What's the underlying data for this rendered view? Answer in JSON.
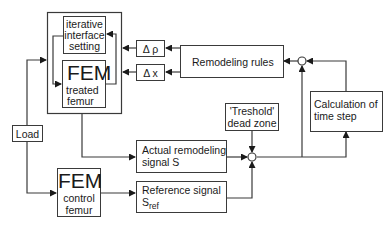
{
  "diagram": {
    "type": "block-flow",
    "blocks": {
      "iterative": {
        "lines": [
          "iterative",
          "interface",
          "setting"
        ]
      },
      "fem_treated": {
        "title": "FEM",
        "lines": [
          "treated",
          "femur"
        ]
      },
      "delta_rho": {
        "label": "Δ ρ"
      },
      "delta_x": {
        "label": "Δ x"
      },
      "remodeling_rules": {
        "label": "Remodeling rules"
      },
      "calc_time_step": {
        "lines": [
          "Calculation of",
          "time step"
        ]
      },
      "threshold": {
        "lines": [
          "'Treshold'",
          "dead zone"
        ]
      },
      "actual_signal": {
        "lines": [
          "Actual remodeling",
          "signal S"
        ]
      },
      "reference_signal": {
        "line1": "Reference signal",
        "symbol": "S",
        "subscript": "ref"
      },
      "load": {
        "label": "Load"
      },
      "fem_control": {
        "title": "FEM",
        "lines": [
          "control",
          "femur"
        ]
      }
    },
    "colors": {
      "line": "#3a3a3a",
      "background": "#ffffff"
    }
  }
}
